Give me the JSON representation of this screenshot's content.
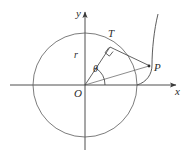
{
  "figure": {
    "background_color": "#ffffff",
    "stroke_color": "#3a3a3a",
    "label_color": "#2b2b2b",
    "axes": {
      "x_label": "x",
      "y_label": "y",
      "origin_label": "O",
      "x_axis_start": [
        10,
        85
      ],
      "x_axis_end": [
        176,
        85
      ],
      "y_axis_start": [
        85,
        150
      ],
      "y_axis_end": [
        85,
        12
      ],
      "arrowheads": [
        "x-positive",
        "y-positive"
      ]
    },
    "circle": {
      "center": [
        85,
        85
      ],
      "radius": 52,
      "label": "circle of radius r centered at O"
    },
    "points": [
      {
        "name": "O",
        "label": "O",
        "x": 85,
        "y": 85,
        "role": "origin-center"
      },
      {
        "name": "T",
        "label": "T",
        "x": 110,
        "y": 47,
        "role": "tangent-point-on-circle"
      },
      {
        "name": "P",
        "label": "P",
        "x": 149,
        "y": 66,
        "role": "point-on-involute"
      }
    ],
    "segments": [
      {
        "name": "radius-OT",
        "label": "r",
        "from": "O",
        "to": "T"
      },
      {
        "name": "tangent-TP",
        "label": "",
        "from": "T",
        "to": "P"
      },
      {
        "name": "chord-OP",
        "label": "",
        "from": "O",
        "to": "P"
      }
    ],
    "angle": {
      "label": "θ",
      "vertex": "O",
      "from_ray": "positive x-axis",
      "to_ray": "OT",
      "degrees": 57
    },
    "right_angle_marker": {
      "at_point": "T",
      "between": [
        "OT",
        "TP"
      ],
      "label": "right angle"
    },
    "curve": {
      "name": "involute",
      "start": [
        137,
        85
      ],
      "through": [
        149,
        66
      ],
      "end": [
        158,
        14
      ],
      "description": "involute of the circle unwinding from the point (r, 0)"
    }
  }
}
